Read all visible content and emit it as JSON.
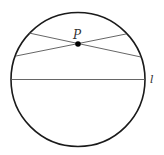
{
  "diagram": {
    "type": "geometry",
    "circle": {
      "cx": 78,
      "cy": 79.5,
      "r": 67,
      "stroke": "#1a1a1a",
      "stroke_width": 1.6
    },
    "chords": [
      {
        "name": "chord-1",
        "x1": 29,
        "y1": 33,
        "x2": 141,
        "y2": 57,
        "stroke": "#555555",
        "stroke_width": 0.9
      },
      {
        "name": "chord-2",
        "x1": 16,
        "y1": 56,
        "x2": 126,
        "y2": 34,
        "stroke": "#555555",
        "stroke_width": 0.9
      }
    ],
    "line_l": {
      "x1": 11,
      "y1": 79.5,
      "x2": 145,
      "y2": 79.5,
      "stroke": "#555555",
      "stroke_width": 0.9
    },
    "point_P": {
      "cx": 78,
      "cy": 44,
      "r": 2.8,
      "fill": "#000000"
    },
    "labels": {
      "point": {
        "text": "P",
        "x": 73,
        "y": 39,
        "size": 12
      },
      "line": {
        "text": "l",
        "x": 150,
        "y": 83,
        "size": 11
      }
    }
  }
}
